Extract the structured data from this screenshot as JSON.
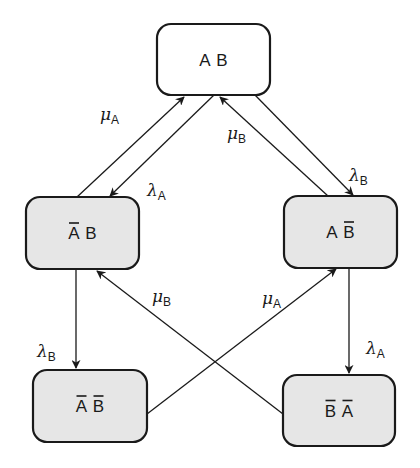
{
  "diagram": {
    "type": "state-transition",
    "colors": {
      "stroke": "#1a1a1a",
      "top_fill": "#ffffff",
      "state_fill": "#e6e6e6"
    },
    "nodes": [
      {
        "id": "AB",
        "parts": [
          {
            "letter": "A",
            "bar": false
          },
          {
            "letter": "B",
            "bar": false
          }
        ],
        "filled": false
      },
      {
        "id": "notA_B",
        "parts": [
          {
            "letter": "A",
            "bar": true
          },
          {
            "letter": "B",
            "bar": false
          }
        ],
        "filled": true
      },
      {
        "id": "A_notB",
        "parts": [
          {
            "letter": "A",
            "bar": false
          },
          {
            "letter": "B",
            "bar": true
          }
        ],
        "filled": true
      },
      {
        "id": "notA_notB",
        "parts": [
          {
            "letter": "A",
            "bar": true
          },
          {
            "letter": "B",
            "bar": true
          }
        ],
        "filled": true
      },
      {
        "id": "notB_notA",
        "parts": [
          {
            "letter": "B",
            "bar": true
          },
          {
            "letter": "A",
            "bar": true
          }
        ],
        "filled": true
      }
    ],
    "edges": [
      {
        "from": "notA_B",
        "to": "AB",
        "symbol": "μ",
        "subscript": "A"
      },
      {
        "from": "AB",
        "to": "notA_B",
        "symbol": "λ",
        "subscript": "A"
      },
      {
        "from": "A_notB",
        "to": "AB",
        "symbol": "μ",
        "subscript": "B"
      },
      {
        "from": "AB",
        "to": "A_notB",
        "symbol": "λ",
        "subscript": "B"
      },
      {
        "from": "notA_B",
        "to": "notA_notB",
        "symbol": "λ",
        "subscript": "B"
      },
      {
        "from": "notB_notA",
        "to": "notA_B",
        "symbol": "μ",
        "subscript": "B"
      },
      {
        "from": "notA_notB",
        "to": "A_notB",
        "symbol": "μ",
        "subscript": "A"
      },
      {
        "from": "A_notB",
        "to": "notB_notA",
        "symbol": "λ",
        "subscript": "A"
      }
    ]
  }
}
